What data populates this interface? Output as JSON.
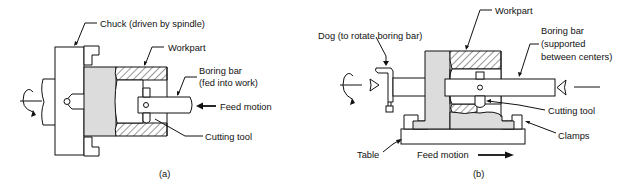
{
  "diagram_a": {
    "caption": "(a)",
    "labels": {
      "chuck": "Chuck (driven by spindle)",
      "workpart": "Workpart",
      "boring_bar_1": "Boring bar",
      "boring_bar_2": "(fed into work)",
      "feed_motion": "Feed motion",
      "cutting_tool": "Cutting tool"
    }
  },
  "diagram_b": {
    "caption": "(b)",
    "labels": {
      "dog": "Dog (to rotate boring bar)",
      "workpart": "Workpart",
      "boring_bar_1": "Boring bar",
      "boring_bar_2": "(supported",
      "boring_bar_3": "between centers)",
      "cutting_tool": "Cutting tool",
      "clamps": "Clamps",
      "table": "Table",
      "feed_motion": "Feed motion"
    }
  },
  "colors": {
    "line": "#111111",
    "workpart_fill": "#dcdcdc",
    "background": "#ffffff"
  }
}
